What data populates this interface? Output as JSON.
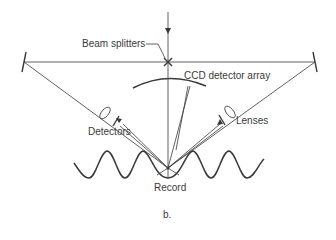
{
  "labels": {
    "beam_splitters": "Beam splitters",
    "ccd_detector_array": "CCD detector array",
    "detectors": "Detectors",
    "lenses": "Lenses",
    "record": "Record",
    "caption": "b."
  },
  "colors": {
    "line": "#3a3a3a",
    "background": "#ffffff"
  }
}
